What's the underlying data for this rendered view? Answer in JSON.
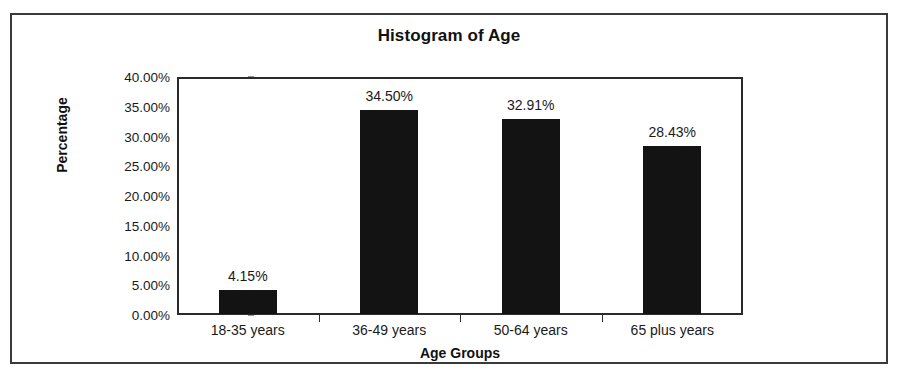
{
  "chart_data": {
    "type": "bar",
    "title": "Histogram of Age",
    "xlabel": "Age Groups",
    "ylabel": "Percentage",
    "categories": [
      "18-35 years",
      "36-49 years",
      "50-64 years",
      "65 plus years"
    ],
    "values": [
      4.15,
      34.5,
      32.91,
      28.43
    ],
    "value_labels": [
      "4.15%",
      "34.50%",
      "32.91%",
      "28.43%"
    ],
    "ylim": [
      0,
      40
    ],
    "ytick_values": [
      0,
      5,
      10,
      15,
      20,
      25,
      30,
      35,
      40
    ],
    "ytick_labels": [
      "0.00%",
      "5.00%",
      "10.00%",
      "15.00%",
      "20.00%",
      "25.00%",
      "30.00%",
      "35.00%",
      "40.00%"
    ],
    "grid": false,
    "legend": false,
    "bar_color": "#131313",
    "axis_color": "#2b2b2b",
    "frame_color": "#3a3a3a",
    "background_color": "#ffffff"
  }
}
